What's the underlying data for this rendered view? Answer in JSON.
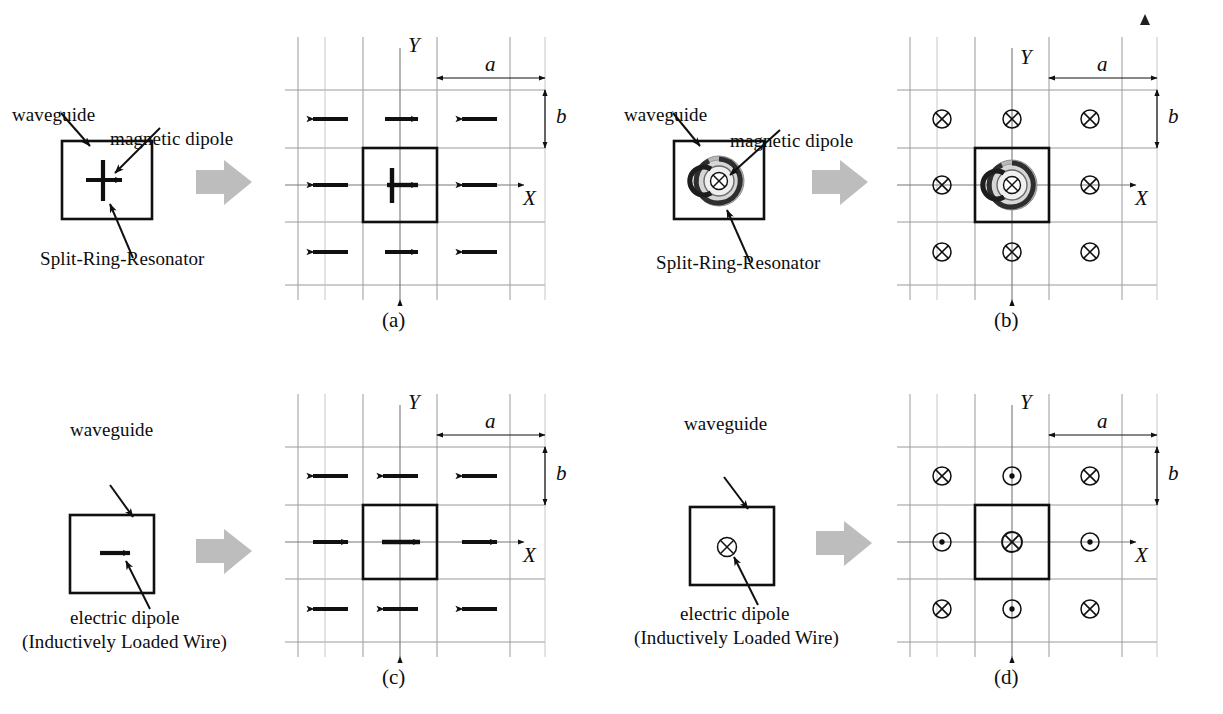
{
  "figure": {
    "caption_partial": "",
    "colors": {
      "ink": "#101010",
      "grid": "#9a9a9a",
      "grid_minor": "#b4b4b4",
      "block_arrow": "#bdbdbd",
      "srr_outer": "#8f8f8f",
      "srr_mid": "#5a5a5a",
      "srr_inner": "#2b2b2b"
    }
  },
  "panels": [
    {
      "id": "a",
      "tag": "(a)",
      "annotations": [
        {
          "name": "waveguide",
          "text": "waveguide"
        },
        {
          "name": "magnetic-dipole",
          "text": "magnetic dipole"
        },
        {
          "name": "split-ring-resonator",
          "text": "Split-Ring-Resonator"
        }
      ],
      "axes": {
        "x_label": "X",
        "y_label": "Y"
      },
      "dims": {
        "a": "a",
        "b": "b"
      },
      "inclusion": "split-ring-resonator-edge-view",
      "lattice": {
        "type": "arrows",
        "description": "Checkerboard in-plane magnetic dipole arrows",
        "rows": [
          [
            "left",
            "right",
            "left"
          ],
          [
            "left",
            "right",
            "left"
          ],
          [
            "left",
            "right",
            "left"
          ]
        ]
      }
    },
    {
      "id": "b",
      "tag": "(b)",
      "annotations": [
        {
          "name": "waveguide",
          "text": "waveguide"
        },
        {
          "name": "magnetic-dipole",
          "text": "magnetic dipole"
        },
        {
          "name": "split-ring-resonator",
          "text": "Split-Ring-Resonator"
        }
      ],
      "axes": {
        "x_label": "X",
        "y_label": "Y"
      },
      "dims": {
        "a": "a",
        "b": "b"
      },
      "inclusion": "split-ring-resonator-face-view",
      "lattice": {
        "type": "symbols",
        "description": "Uniform into-page magnetic dipoles",
        "rows": [
          [
            "into",
            "into",
            "into"
          ],
          [
            "into",
            "into",
            "into"
          ],
          [
            "into",
            "into",
            "into"
          ]
        ]
      }
    },
    {
      "id": "c",
      "tag": "(c)",
      "annotations": [
        {
          "name": "waveguide",
          "text": "waveguide"
        },
        {
          "name": "electric-dipole",
          "text": "electric dipole"
        },
        {
          "name": "electric-dipole-sub",
          "text": "(Inductively Loaded Wire)"
        }
      ],
      "axes": {
        "x_label": "X",
        "y_label": "Y"
      },
      "dims": {
        "a": "a",
        "b": "b"
      },
      "inclusion": "inductively-loaded-wire-arrow",
      "lattice": {
        "type": "arrows",
        "description": "Row-alternating in-plane electric dipole arrows",
        "rows": [
          [
            "left",
            "left",
            "left"
          ],
          [
            "right",
            "right",
            "right"
          ],
          [
            "left",
            "left",
            "left"
          ]
        ]
      }
    },
    {
      "id": "d",
      "tag": "(d)",
      "annotations": [
        {
          "name": "waveguide",
          "text": "waveguide"
        },
        {
          "name": "electric-dipole",
          "text": "electric dipole"
        },
        {
          "name": "electric-dipole-sub",
          "text": "(Inductively Loaded Wire)"
        }
      ],
      "axes": {
        "x_label": "X",
        "y_label": "Y"
      },
      "dims": {
        "a": "a",
        "b": "b"
      },
      "inclusion": "inductively-loaded-wire-into-page",
      "lattice": {
        "type": "symbols",
        "description": "Checkerboard into-page / out-of-page electric dipoles",
        "rows": [
          [
            "into",
            "out",
            "into"
          ],
          [
            "out",
            "into",
            "out"
          ],
          [
            "into",
            "out",
            "into"
          ]
        ]
      }
    }
  ],
  "symbols": {
    "into_page": "⊗",
    "out_of_page": "⊙",
    "arrow_left": "←",
    "arrow_right": "→"
  }
}
